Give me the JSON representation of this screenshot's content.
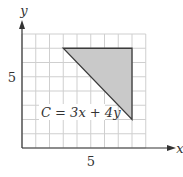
{
  "chart_data": {
    "type": "diagram",
    "title": "",
    "xlabel": "x",
    "ylabel": "y",
    "x_tick_label": "5",
    "y_tick_label": "5",
    "xlim": [
      0,
      9
    ],
    "ylim": [
      0,
      8
    ],
    "grid": true,
    "grid_step": 1,
    "feasible_region": {
      "shape": "triangle",
      "vertices": [
        [
          3,
          7
        ],
        [
          8,
          7
        ],
        [
          8,
          2
        ]
      ],
      "fill": "#c9c9c9",
      "stroke": "#3a3a3a"
    },
    "annotation": {
      "text": "C = 3x + 4y",
      "position": [
        1.3,
        2.6
      ]
    }
  },
  "colors": {
    "grid": "#cfcfcf",
    "axis": "#333333",
    "region_fill": "#c9c9c9",
    "region_stroke": "#3a3a3a"
  },
  "labels": {
    "x_axis": "x",
    "y_axis": "y",
    "x_tick": "5",
    "y_tick": "5",
    "objective": "C = 3x + 4y"
  }
}
